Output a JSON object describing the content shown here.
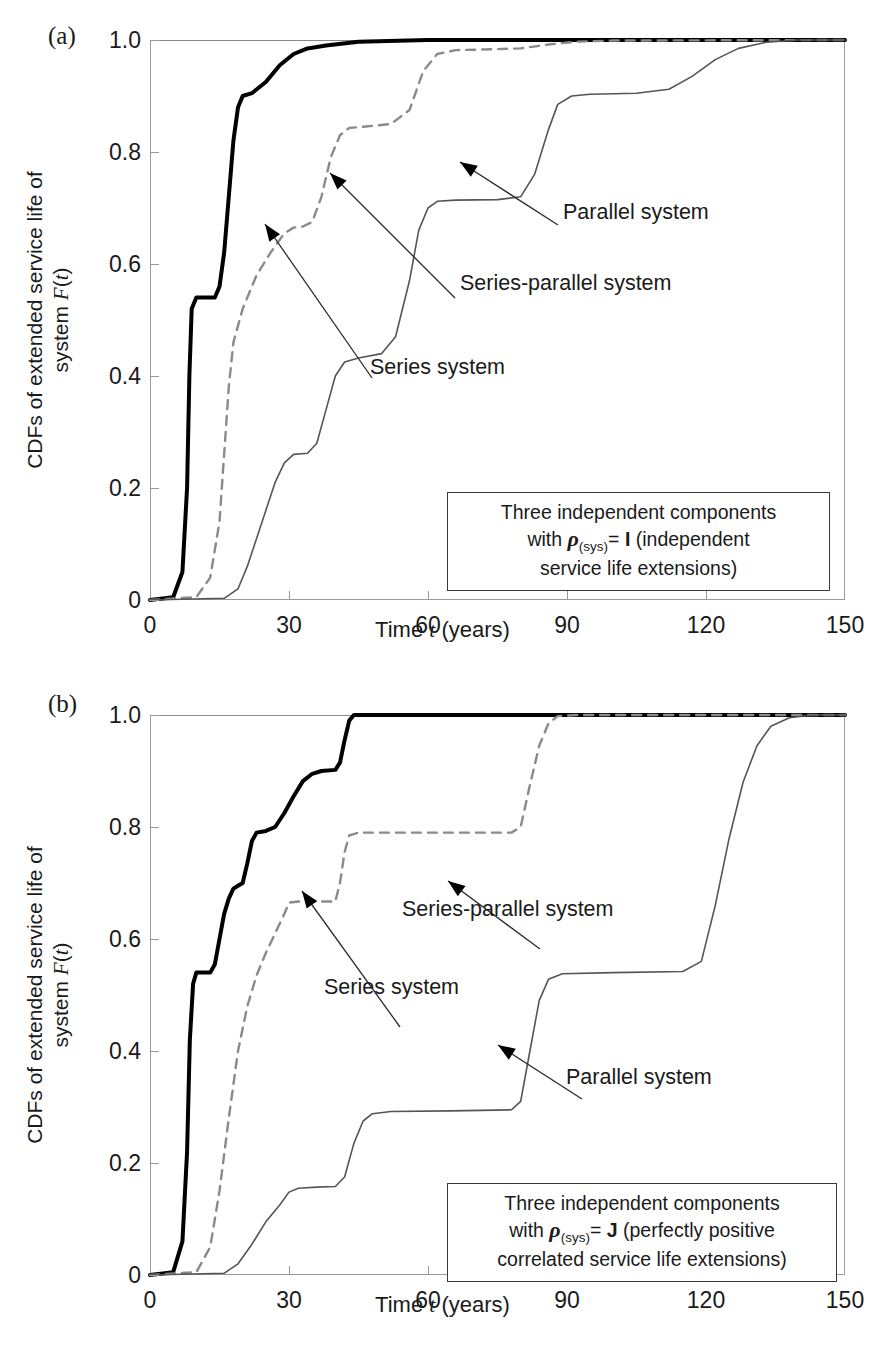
{
  "figure": {
    "panels": [
      {
        "label": "(a)",
        "note_line1": "Three independent components",
        "note_line2_pre": "with ",
        "note_rho": "ρ",
        "note_sub": "(sys)",
        "note_line2_post": "= ",
        "note_matrix": "I",
        "note_line2_tail": " (independent",
        "note_line3": "service life extensions)",
        "annotations": [
          {
            "name": "parallel",
            "text": "Parallel system"
          },
          {
            "name": "series-parallel",
            "text": "Series-parallel  system"
          },
          {
            "name": "series",
            "text": "Series system"
          }
        ]
      },
      {
        "label": "(b)",
        "note_line1": "Three independent components",
        "note_line2_pre": "with ",
        "note_rho": "ρ",
        "note_sub": "(sys)",
        "note_line2_post": "= ",
        "note_matrix": "J",
        "note_line2_tail": " (perfectly positive",
        "note_line3": "correlated service life extensions)",
        "annotations": [
          {
            "name": "series-parallel",
            "text": "Series-parallel  system"
          },
          {
            "name": "series",
            "text": "Series system"
          },
          {
            "name": "parallel",
            "text": "Parallel system"
          }
        ]
      }
    ],
    "axis": {
      "ylabel_line1": "CDFs of extended service life of",
      "ylabel_line2_pre": "system ",
      "ylabel_line2_italic": "F",
      "ylabel_line2_post": "(",
      "ylabel_line2_italic2": "t",
      "ylabel_line2_tail": ")",
      "xlabel_pre": "Time ",
      "xlabel_italic": "t",
      "xlabel_post": " (years)"
    }
  },
  "chart_data": [
    {
      "type": "line",
      "title": "(a) Three independent components with rho_(sys) = I (independent service life extensions)",
      "xlabel": "Time t (years)",
      "ylabel": "CDFs of extended service life of system F(t)",
      "xlim": [
        0,
        150
      ],
      "ylim": [
        0,
        1.0
      ],
      "xticks": [
        0,
        30,
        60,
        90,
        120,
        150
      ],
      "yticks": [
        0,
        0.2,
        0.4,
        0.6,
        0.8,
        1.0
      ],
      "grid": false,
      "legend": "inline-annotations",
      "series": [
        {
          "name": "Series system",
          "style": "solid-bold",
          "color": "#000000",
          "points": [
            [
              0,
              0.0
            ],
            [
              5,
              0.005
            ],
            [
              7,
              0.05
            ],
            [
              8,
              0.2
            ],
            [
              8.5,
              0.4
            ],
            [
              9,
              0.52
            ],
            [
              10,
              0.54
            ],
            [
              14,
              0.54
            ],
            [
              15,
              0.56
            ],
            [
              16,
              0.62
            ],
            [
              17,
              0.72
            ],
            [
              18,
              0.82
            ],
            [
              19,
              0.88
            ],
            [
              20,
              0.9
            ],
            [
              22,
              0.905
            ],
            [
              25,
              0.925
            ],
            [
              28,
              0.955
            ],
            [
              31,
              0.975
            ],
            [
              34,
              0.985
            ],
            [
              38,
              0.99
            ],
            [
              45,
              0.997
            ],
            [
              60,
              1.0
            ],
            [
              150,
              1.0
            ]
          ]
        },
        {
          "name": "Series-parallel system",
          "style": "dashed",
          "color": "#8a8a8a",
          "points": [
            [
              0,
              0.0
            ],
            [
              10,
              0.005
            ],
            [
              13,
              0.04
            ],
            [
              15,
              0.14
            ],
            [
              16,
              0.26
            ],
            [
              17,
              0.38
            ],
            [
              18,
              0.46
            ],
            [
              20,
              0.52
            ],
            [
              23,
              0.58
            ],
            [
              26,
              0.62
            ],
            [
              29,
              0.655
            ],
            [
              31,
              0.665
            ],
            [
              33,
              0.667
            ],
            [
              35,
              0.675
            ],
            [
              37,
              0.72
            ],
            [
              39,
              0.79
            ],
            [
              41,
              0.83
            ],
            [
              43,
              0.843
            ],
            [
              46,
              0.845
            ],
            [
              52,
              0.85
            ],
            [
              56,
              0.875
            ],
            [
              59,
              0.945
            ],
            [
              62,
              0.975
            ],
            [
              66,
              0.982
            ],
            [
              72,
              0.983
            ],
            [
              80,
              0.985
            ],
            [
              86,
              0.992
            ],
            [
              92,
              0.997
            ],
            [
              100,
              0.999
            ],
            [
              150,
              1.0
            ]
          ]
        },
        {
          "name": "Parallel system",
          "style": "solid-thin",
          "color": "#555555",
          "points": [
            [
              0,
              0.0
            ],
            [
              16,
              0.003
            ],
            [
              19,
              0.02
            ],
            [
              21,
              0.06
            ],
            [
              23,
              0.11
            ],
            [
              25,
              0.16
            ],
            [
              27,
              0.21
            ],
            [
              29,
              0.245
            ],
            [
              31,
              0.26
            ],
            [
              34,
              0.262
            ],
            [
              36,
              0.28
            ],
            [
              38,
              0.34
            ],
            [
              40,
              0.4
            ],
            [
              42,
              0.425
            ],
            [
              45,
              0.432
            ],
            [
              50,
              0.44
            ],
            [
              53,
              0.47
            ],
            [
              56,
              0.57
            ],
            [
              58,
              0.66
            ],
            [
              60,
              0.7
            ],
            [
              62,
              0.712
            ],
            [
              66,
              0.714
            ],
            [
              75,
              0.715
            ],
            [
              80,
              0.72
            ],
            [
              83,
              0.76
            ],
            [
              86,
              0.84
            ],
            [
              88,
              0.885
            ],
            [
              91,
              0.9
            ],
            [
              95,
              0.903
            ],
            [
              105,
              0.905
            ],
            [
              112,
              0.912
            ],
            [
              117,
              0.935
            ],
            [
              122,
              0.965
            ],
            [
              127,
              0.985
            ],
            [
              133,
              0.996
            ],
            [
              140,
              1.0
            ],
            [
              150,
              1.0
            ]
          ]
        }
      ]
    },
    {
      "type": "line",
      "title": "(b) Three independent components with rho_(sys) = J (perfectly positive correlated service life extensions)",
      "xlabel": "Time t (years)",
      "ylabel": "CDFs of extended service life of system F(t)",
      "xlim": [
        0,
        150
      ],
      "ylim": [
        0,
        1.0
      ],
      "xticks": [
        0,
        30,
        60,
        90,
        120,
        150
      ],
      "yticks": [
        0,
        0.2,
        0.4,
        0.6,
        0.8,
        1.0
      ],
      "grid": false,
      "legend": "inline-annotations",
      "series": [
        {
          "name": "Series system",
          "style": "solid-bold",
          "color": "#000000",
          "points": [
            [
              0,
              0.0
            ],
            [
              5,
              0.005
            ],
            [
              7,
              0.06
            ],
            [
              8,
              0.22
            ],
            [
              8.6,
              0.42
            ],
            [
              9.3,
              0.52
            ],
            [
              10,
              0.54
            ],
            [
              13,
              0.54
            ],
            [
              14,
              0.555
            ],
            [
              15,
              0.6
            ],
            [
              16,
              0.645
            ],
            [
              17,
              0.672
            ],
            [
              18,
              0.69
            ],
            [
              19,
              0.695
            ],
            [
              20,
              0.7
            ],
            [
              21,
              0.735
            ],
            [
              22,
              0.775
            ],
            [
              23,
              0.79
            ],
            [
              25,
              0.793
            ],
            [
              27,
              0.8
            ],
            [
              29,
              0.825
            ],
            [
              31,
              0.855
            ],
            [
              33,
              0.882
            ],
            [
              35,
              0.895
            ],
            [
              37,
              0.9
            ],
            [
              40,
              0.902
            ],
            [
              41,
              0.915
            ],
            [
              42,
              0.955
            ],
            [
              43,
              0.99
            ],
            [
              44,
              1.0
            ],
            [
              150,
              1.0
            ]
          ]
        },
        {
          "name": "Series-parallel system",
          "style": "dashed",
          "color": "#8a8a8a",
          "points": [
            [
              0,
              0.0
            ],
            [
              10,
              0.005
            ],
            [
              13,
              0.05
            ],
            [
              15,
              0.15
            ],
            [
              17,
              0.28
            ],
            [
              19,
              0.4
            ],
            [
              21,
              0.48
            ],
            [
              23,
              0.535
            ],
            [
              25,
              0.575
            ],
            [
              27,
              0.61
            ],
            [
              29,
              0.645
            ],
            [
              30,
              0.665
            ],
            [
              32,
              0.667
            ],
            [
              38,
              0.667
            ],
            [
              40,
              0.667
            ],
            [
              41,
              0.7
            ],
            [
              42,
              0.755
            ],
            [
              43,
              0.785
            ],
            [
              45,
              0.79
            ],
            [
              60,
              0.79
            ],
            [
              78,
              0.79
            ],
            [
              80,
              0.8
            ],
            [
              82,
              0.875
            ],
            [
              84,
              0.945
            ],
            [
              86,
              0.985
            ],
            [
              88,
              0.998
            ],
            [
              92,
              1.0
            ],
            [
              150,
              1.0
            ]
          ]
        },
        {
          "name": "Parallel system",
          "style": "solid-thin",
          "color": "#555555",
          "points": [
            [
              0,
              0.0
            ],
            [
              16,
              0.003
            ],
            [
              19,
              0.02
            ],
            [
              22,
              0.055
            ],
            [
              25,
              0.095
            ],
            [
              28,
              0.125
            ],
            [
              30,
              0.148
            ],
            [
              32,
              0.155
            ],
            [
              36,
              0.157
            ],
            [
              40,
              0.158
            ],
            [
              42,
              0.175
            ],
            [
              44,
              0.235
            ],
            [
              46,
              0.275
            ],
            [
              48,
              0.288
            ],
            [
              52,
              0.292
            ],
            [
              65,
              0.293
            ],
            [
              78,
              0.295
            ],
            [
              80,
              0.31
            ],
            [
              82,
              0.4
            ],
            [
              84,
              0.49
            ],
            [
              86,
              0.528
            ],
            [
              89,
              0.538
            ],
            [
              100,
              0.54
            ],
            [
              115,
              0.542
            ],
            [
              119,
              0.56
            ],
            [
              122,
              0.66
            ],
            [
              125,
              0.78
            ],
            [
              128,
              0.88
            ],
            [
              131,
              0.945
            ],
            [
              134,
              0.98
            ],
            [
              138,
              0.995
            ],
            [
              143,
              1.0
            ],
            [
              150,
              1.0
            ]
          ]
        }
      ]
    }
  ]
}
